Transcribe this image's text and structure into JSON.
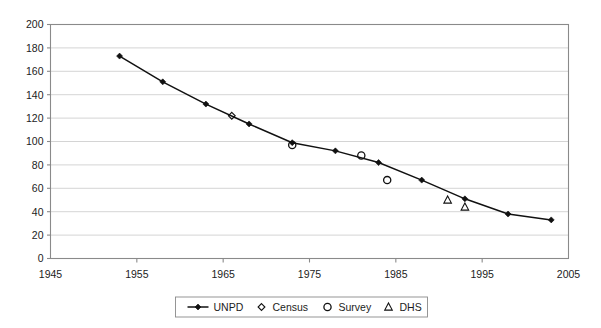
{
  "chart_data": {
    "type": "line",
    "title": "",
    "xlabel": "",
    "ylabel": "",
    "xlim": [
      1945,
      2005
    ],
    "ylim": [
      0,
      200
    ],
    "grid": "horizontal",
    "legend_position": "bottom",
    "x_ticks": [
      "1945",
      "1955",
      "1965",
      "1975",
      "1985",
      "1995",
      "2005"
    ],
    "y_ticks": [
      "0",
      "20",
      "40",
      "60",
      "80",
      "100",
      "120",
      "140",
      "160",
      "180",
      "200"
    ],
    "series": [
      {
        "name": "UNPD",
        "marker": "filled-diamond",
        "line": true,
        "points": [
          {
            "x": 1953,
            "y": 173
          },
          {
            "x": 1958,
            "y": 151
          },
          {
            "x": 1963,
            "y": 132
          },
          {
            "x": 1968,
            "y": 115
          },
          {
            "x": 1973,
            "y": 99
          },
          {
            "x": 1978,
            "y": 92
          },
          {
            "x": 1983,
            "y": 82
          },
          {
            "x": 1988,
            "y": 67
          },
          {
            "x": 1993,
            "y": 51
          },
          {
            "x": 1998,
            "y": 38
          },
          {
            "x": 2003,
            "y": 33
          }
        ]
      },
      {
        "name": "Census",
        "marker": "open-diamond",
        "line": false,
        "points": [
          {
            "x": 1966,
            "y": 122
          }
        ]
      },
      {
        "name": "Survey",
        "marker": "open-circle",
        "line": false,
        "points": [
          {
            "x": 1973,
            "y": 97
          },
          {
            "x": 1981,
            "y": 88
          },
          {
            "x": 1984,
            "y": 67
          }
        ]
      },
      {
        "name": "DHS",
        "marker": "open-triangle",
        "line": false,
        "points": [
          {
            "x": 1991,
            "y": 50
          },
          {
            "x": 1993,
            "y": 44
          }
        ]
      }
    ]
  },
  "legend": {
    "items": [
      {
        "label": "UNPD",
        "marker": "line-with-filled-diamond"
      },
      {
        "label": "Census",
        "marker": "open-diamond"
      },
      {
        "label": "Survey",
        "marker": "open-circle"
      },
      {
        "label": "DHS",
        "marker": "open-triangle"
      }
    ]
  },
  "colors": {
    "series": "#111111",
    "grid": "#c9c9c9",
    "axis": "#8a8a8a",
    "background": "#ffffff"
  }
}
